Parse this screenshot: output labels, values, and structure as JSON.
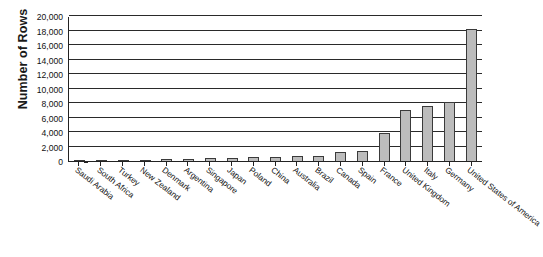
{
  "chart_data": {
    "type": "bar",
    "title": "",
    "xlabel": "",
    "ylabel": "Number of Rows",
    "ylim": [
      0,
      20000
    ],
    "ytick_values": [
      0,
      2000,
      4000,
      6000,
      8000,
      10000,
      12000,
      14000,
      16000,
      18000,
      20000
    ],
    "ytick_labels": [
      "0",
      "2,000",
      "4,000",
      "6,000",
      "8,000",
      "10,000",
      "12,000",
      "14,000",
      "16,000",
      "18,000",
      "20,000"
    ],
    "grid": true,
    "legend": null,
    "categories": [
      "Saudi Arabia",
      "South Africa",
      "Turkey",
      "New Zealand",
      "Denmark",
      "Argentina",
      "Singapore",
      "Japan",
      "Poland",
      "China",
      "Australia",
      "Brazil",
      "Canada",
      "Spain",
      "France",
      "United Kingdom",
      "Italy",
      "Germany",
      "United States of America"
    ],
    "values": [
      100,
      120,
      150,
      200,
      250,
      330,
      420,
      450,
      520,
      600,
      650,
      700,
      1300,
      1350,
      3900,
      7000,
      7600,
      8200,
      18200
    ],
    "bar_color": "#bcbcbc",
    "bar_border_color": "#3a3a3a",
    "axis_color": "#222222",
    "grid_color": "#2a2a2a"
  }
}
